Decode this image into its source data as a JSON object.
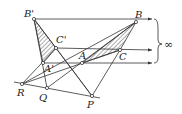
{
  "diagram": {
    "points": [
      {
        "name": "B'",
        "x": 34,
        "y": 19,
        "lx": 24,
        "ly": 9
      },
      {
        "name": "B",
        "x": 136,
        "y": 22,
        "lx": 135,
        "ly": 11
      },
      {
        "name": "C'",
        "x": 56,
        "y": 48,
        "lx": 56,
        "ly": 36
      },
      {
        "name": "C",
        "x": 120,
        "y": 50,
        "lx": 119,
        "ly": 52
      },
      {
        "name": "A'",
        "x": 43,
        "y": 63,
        "lx": 43,
        "ly": 64
      },
      {
        "name": "A",
        "x": 82,
        "y": 63,
        "lx": 79,
        "ly": 52
      },
      {
        "name": "R",
        "x": 22,
        "y": 84,
        "lx": 17,
        "ly": 87
      },
      {
        "name": "Q",
        "x": 47,
        "y": 88,
        "lx": 39,
        "ly": 93
      },
      {
        "name": "P",
        "x": 92,
        "y": 96,
        "lx": 87,
        "ly": 100
      }
    ],
    "infinity_label": "∞",
    "colors": {
      "line": "#333333",
      "hatch": "#555555"
    }
  }
}
